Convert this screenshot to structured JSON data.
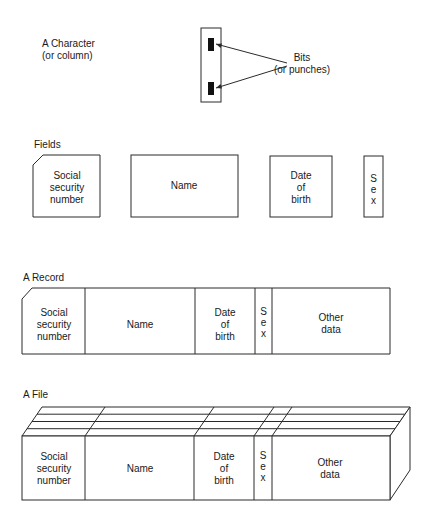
{
  "character": {
    "title_line1": "A Character",
    "title_line2": "(or column)",
    "bits_line1": "Bits",
    "bits_line2": "(or punches)"
  },
  "fields": {
    "title": "Fields",
    "ssn": [
      "Social",
      "security",
      "number"
    ],
    "name": "Name",
    "dob": [
      "Date",
      "of",
      "birth"
    ],
    "sex": [
      "S",
      "e",
      "x"
    ]
  },
  "record": {
    "title": "A Record",
    "ssn": [
      "Social",
      "security",
      "number"
    ],
    "name": "Name",
    "dob": [
      "Date",
      "of",
      "birth"
    ],
    "sex": [
      "S",
      "e",
      "x"
    ],
    "other": [
      "Other",
      "data"
    ]
  },
  "file": {
    "title": "A File",
    "ssn": [
      "Social",
      "security",
      "number"
    ],
    "name": "Name",
    "dob": [
      "Date",
      "of",
      "birth"
    ],
    "sex": [
      "S",
      "e",
      "x"
    ],
    "other": [
      "Other",
      "data"
    ]
  },
  "colors": {
    "line": "#2a2a2a",
    "bit": "#111111",
    "background": "#ffffff"
  }
}
